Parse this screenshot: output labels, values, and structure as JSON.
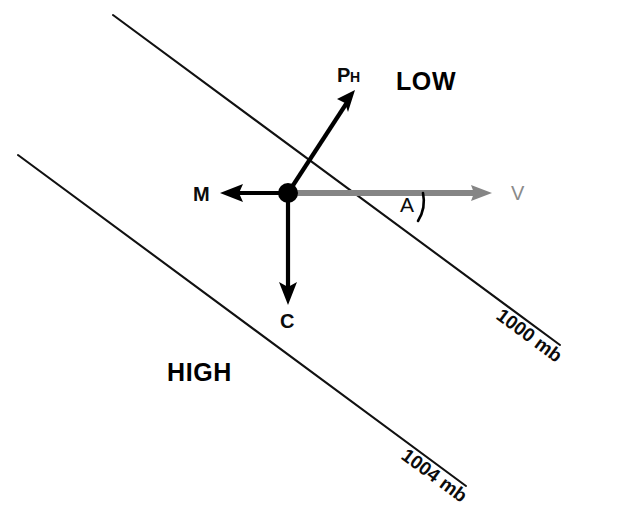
{
  "figure": {
    "type": "diagram",
    "background_color": "#ffffff",
    "width": 620,
    "height": 518
  },
  "colors": {
    "line_black": "#111111",
    "vector_black": "#000000",
    "vector_gray": "#858585",
    "label_gray": "#8a8a8a",
    "background": "#ffffff"
  },
  "pressure_labels": {
    "low": "LOW",
    "high": "HIGH"
  },
  "isobars": [
    {
      "id": "isobar-1000",
      "label": "1000 mb",
      "value": 1000,
      "unit": "mb",
      "x1": 113,
      "y1": 15,
      "x2": 560,
      "y2": 345,
      "label_x": 495,
      "label_y": 318,
      "label_rotation": 36.4
    },
    {
      "id": "isobar-1004",
      "label": "1004 mb",
      "value": 1004,
      "unit": "mb",
      "x1": 18,
      "y1": 155,
      "x2": 466,
      "y2": 486,
      "label_x": 400,
      "label_y": 458,
      "label_rotation": 36.4
    }
  ],
  "station": {
    "label": "air-parcel",
    "x": 288,
    "y": 193,
    "radius": 9
  },
  "vectors": [
    {
      "id": "vector-ph",
      "symbol": "P",
      "subscript": "H",
      "name": "horizontal-pressure-gradient-force",
      "color": "#000000",
      "x1": 288,
      "y1": 193,
      "x2": 354,
      "y2": 92,
      "label_x": 340,
      "label_y": 82
    },
    {
      "id": "vector-m",
      "symbol": "M",
      "subscript": "",
      "name": "frictional-force",
      "color": "#000000",
      "x1": 288,
      "y1": 193,
      "x2": 221,
      "y2": 193,
      "label_x": 196,
      "label_y": 200
    },
    {
      "id": "vector-c",
      "symbol": "C",
      "subscript": "",
      "name": "coriolis-force",
      "color": "#000000",
      "x1": 288,
      "y1": 193,
      "x2": 288,
      "y2": 304,
      "label_x": 282,
      "label_y": 327
    },
    {
      "id": "vector-v",
      "symbol": "V",
      "subscript": "",
      "name": "wind-velocity",
      "color": "#858585",
      "x1": 288,
      "y1": 193,
      "x2": 492,
      "y2": 193,
      "label_x": 511,
      "label_y": 200
    }
  ],
  "angle": {
    "id": "angle-a",
    "label": "A",
    "name": "cross-isobar-flow-angle",
    "label_x": 402,
    "label_y": 211,
    "vertex_x": 439,
    "vertex_y": 193,
    "radius": 44
  }
}
